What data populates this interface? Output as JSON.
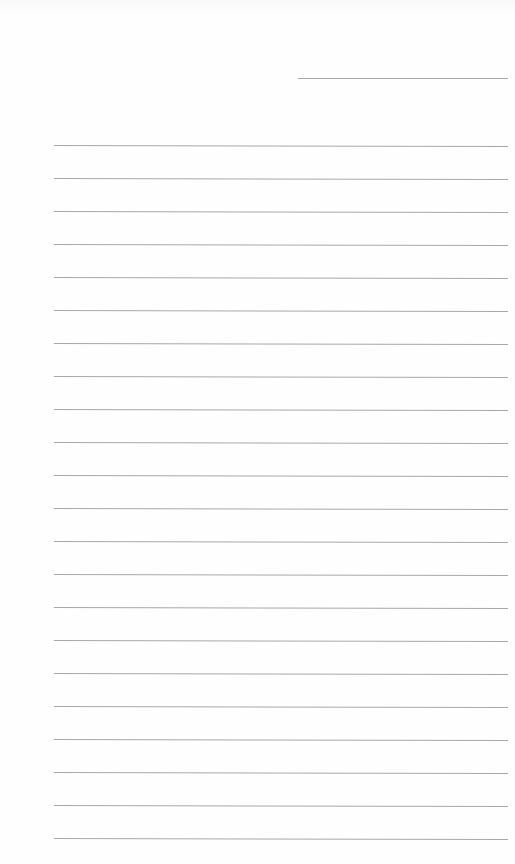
{
  "document": {
    "type": "lined-paper",
    "background_color": "#fefefe",
    "line_color": "#a8a8a8",
    "header_line": {
      "x1": 298,
      "x2": 508,
      "y": 78
    },
    "rules": {
      "x1": 54,
      "x2": 508,
      "count": 22,
      "y_positions": [
        145,
        178,
        211,
        244,
        277,
        310,
        343,
        376,
        409,
        442,
        475,
        508,
        541,
        574,
        607,
        640,
        673,
        706,
        739,
        772,
        805,
        838
      ]
    },
    "text": []
  }
}
